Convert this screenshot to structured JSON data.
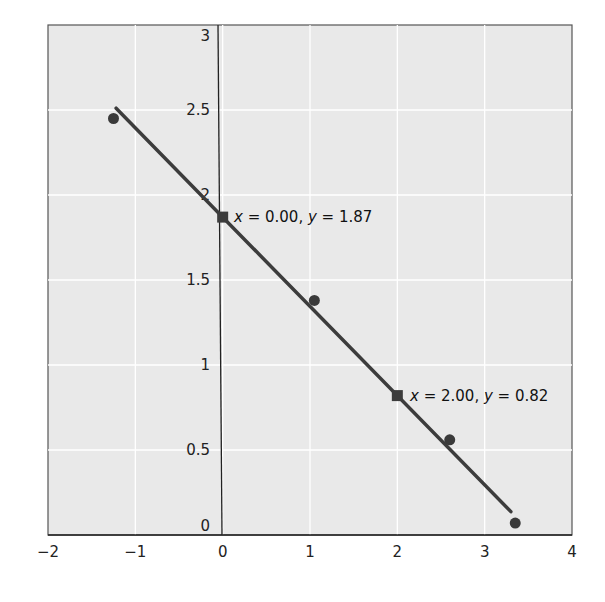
{
  "chart_data": {
    "type": "scatter",
    "title": "",
    "xlabel": "",
    "ylabel": "",
    "xlim": [
      -2,
      4
    ],
    "ylim": [
      0,
      3
    ],
    "grid": true,
    "x_ticks": [
      "−2",
      "−1",
      "0",
      "1",
      "2",
      "3",
      "4"
    ],
    "y_ticks": [
      "0",
      "0.5",
      "1",
      "1.5",
      "2",
      "2.5",
      "3"
    ],
    "series": [
      {
        "name": "data points",
        "kind": "scatter",
        "points": [
          {
            "x": -1.25,
            "y": 2.45
          },
          {
            "x": 1.05,
            "y": 1.38
          },
          {
            "x": 2.6,
            "y": 0.56
          },
          {
            "x": 3.35,
            "y": 0.07
          }
        ]
      },
      {
        "name": "regression line",
        "kind": "line",
        "slope": -0.525,
        "intercept": 1.87,
        "x_range": [
          -1.22,
          3.3
        ]
      }
    ],
    "annotations": [
      {
        "x": 0.0,
        "y": 1.87,
        "marker": "square",
        "label_x": "0.00",
        "label_y": "1.87"
      },
      {
        "x": 2.0,
        "y": 0.82,
        "marker": "square",
        "label_x": "2.00",
        "label_y": "0.82"
      }
    ],
    "colors": {
      "plot_background": "#e9e9e9",
      "grid": "#ffffff",
      "line": "#3c3c3c",
      "points": "#3a3a3a",
      "axis": "#222222"
    }
  },
  "labels": {
    "ann1_x": "x",
    "ann1_eq1": " = 0.00, ",
    "ann1_y": "y",
    "ann1_eq2": " = 1.87",
    "ann2_x": "x",
    "ann2_eq1": " = 2.00, ",
    "ann2_y": "y",
    "ann2_eq2": " = 0.82"
  }
}
